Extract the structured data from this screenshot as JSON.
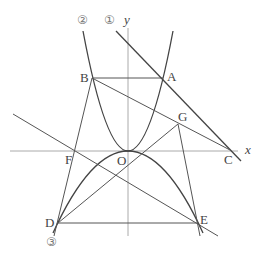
{
  "diagram": {
    "axes": {
      "x_label": "x",
      "y_label": "y",
      "origin_label": "O"
    },
    "curve_labels": {
      "c1": "①",
      "c2": "②",
      "c3": "③"
    },
    "points": {
      "A": "A",
      "B": "B",
      "C": "C",
      "D": "D",
      "E": "E",
      "F": "F",
      "G": "G"
    },
    "colors": {
      "curve": "#444444",
      "line": "#555555",
      "axis": "#999999",
      "label": "#444444"
    }
  }
}
